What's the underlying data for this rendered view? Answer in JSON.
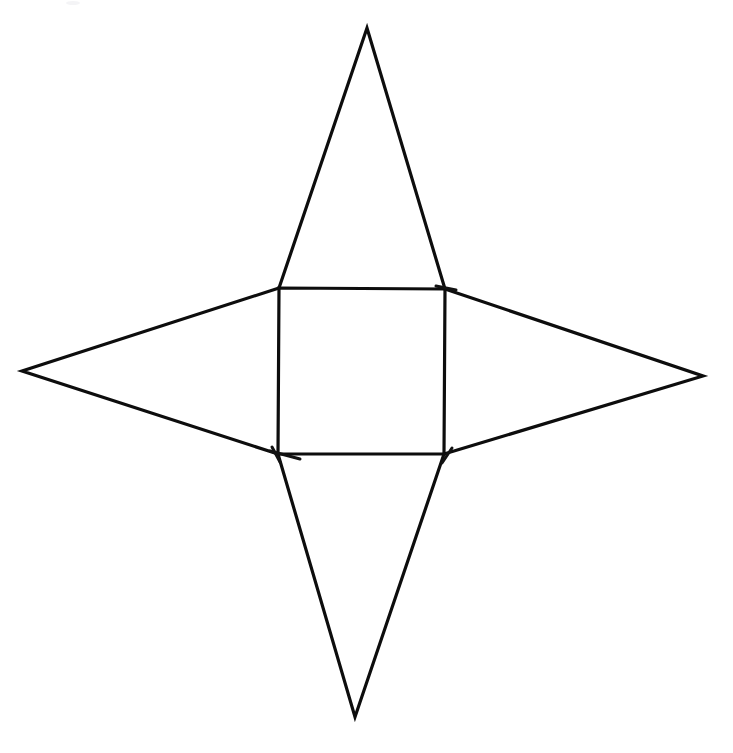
{
  "document": {
    "title": "Four-Pointed Star Net Diagram",
    "background_color": "#ffffff",
    "ink_color": "#0d0d0d",
    "width": 733,
    "height": 753,
    "description": "Line drawing of a four-pointed star: a central square with an isosceles triangle spike on the top and bottom edges and a wide triangular spike on the left and right sides."
  },
  "figure": {
    "name": "four-pointed-star-net",
    "stroke_width": 3.2,
    "square": {
      "name": "central-square",
      "top_left": [
        279,
        288
      ],
      "top_right": [
        445,
        289
      ],
      "bottom_right": [
        444,
        454
      ],
      "bottom_left": [
        278,
        454
      ],
      "path": "M 279 288 L 445 289 L 444 454 L 278 454 Z"
    },
    "spikes": [
      {
        "name": "top-spike",
        "apex": [
          367,
          28
        ],
        "base_left": [
          279,
          288
        ],
        "base_right": [
          445,
          289
        ],
        "path": "M 279 288 L 367 28 L 445 289"
      },
      {
        "name": "right-spike",
        "apex": [
          703,
          376
        ],
        "base_top": [
          445,
          289
        ],
        "base_bottom": [
          444,
          454
        ],
        "path": "M 445 289 L 703 376 L 444 454"
      },
      {
        "name": "bottom-spike",
        "apex": [
          355,
          717
        ],
        "base_left": [
          278,
          454
        ],
        "base_right": [
          444,
          454
        ],
        "path": "M 278 454 L 355 717 L 444 454"
      },
      {
        "name": "left-spike",
        "apex": [
          22,
          371
        ],
        "base_top": [
          279,
          288
        ],
        "base_bottom": [
          278,
          454
        ],
        "path": "M 279 288 L 22 371 L 278 454"
      }
    ],
    "overshoots": [
      {
        "name": "left-spike-lower-overshoot",
        "path": "M 270 451 L 300 459"
      },
      {
        "name": "right-spike-upper-overshoot",
        "path": "M 436 286 L 456 290"
      },
      {
        "name": "bottom-left-corner-overshoot",
        "path": "M 272 447 L 280 462"
      },
      {
        "name": "bottom-right-corner-overshoot",
        "path": "M 452 448 L 442 463"
      }
    ]
  },
  "artifacts": [
    {
      "name": "scan-speck-top",
      "x": 66,
      "y": 1,
      "width": 14,
      "height": 4
    }
  ]
}
